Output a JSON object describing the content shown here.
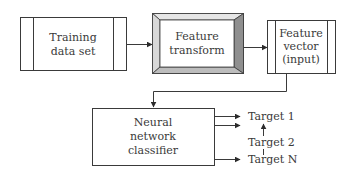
{
  "diagram": {
    "type": "flowchart",
    "nodes": {
      "training": {
        "lines": [
          "Training",
          "data set"
        ]
      },
      "transform": {
        "lines": [
          "Feature",
          "transform"
        ]
      },
      "vector": {
        "lines": [
          "Feature",
          "vector",
          "(input)"
        ]
      },
      "classifier": {
        "lines": [
          "Neural",
          "network",
          "classifier"
        ]
      }
    },
    "targets": [
      "Target 1",
      "Target 2",
      "Target N"
    ],
    "edges": [
      {
        "from": "Training data set",
        "to": "Feature transform"
      },
      {
        "from": "Feature transform",
        "to": "Feature vector (input)"
      },
      {
        "from": "Feature vector (input)",
        "to": "Neural network classifier"
      },
      {
        "from": "Neural network classifier",
        "to": "Target 1"
      },
      {
        "from": "Neural network classifier",
        "to": "Target 2"
      },
      {
        "from": "Neural network classifier",
        "to": "Target N"
      }
    ],
    "colors": {
      "stroke": "#3a3a3a",
      "bevel_light": "#e6e6e6",
      "bevel_mid": "#bdbdbd",
      "bevel_dark": "#8f8f8f",
      "background": "#ffffff"
    }
  }
}
